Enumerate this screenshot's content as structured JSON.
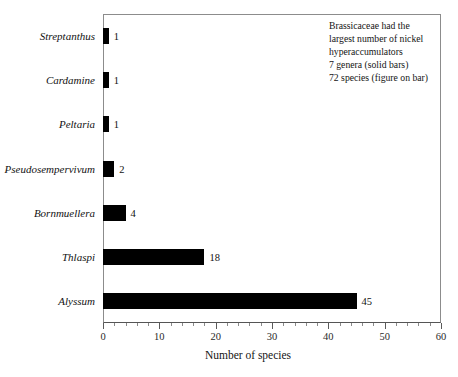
{
  "chart_data": {
    "type": "bar",
    "orientation": "horizontal",
    "title": "",
    "xlabel": "Number of species",
    "ylabel": "",
    "xlim": [
      0,
      60
    ],
    "xticks": [
      0,
      10,
      20,
      30,
      40,
      50,
      60
    ],
    "xtick_labels": [
      "0",
      "10",
      "20",
      "30",
      "40",
      "50",
      "60"
    ],
    "minor_tick_step": 2,
    "grid": false,
    "legend": false,
    "bar_color": "#000000",
    "categories": [
      "Streptanthus",
      "Cardamine",
      "Peltaria",
      "Pseudosempervivum",
      "Bornmuellera",
      "Thlaspi",
      "Alyssum"
    ],
    "values": [
      1,
      1,
      1,
      2,
      4,
      18,
      45
    ],
    "data_labels": [
      "1",
      "1",
      "1",
      "2",
      "4",
      "18",
      "45"
    ],
    "bars": [
      {
        "category": "Streptanthus",
        "value": 1,
        "label": "1"
      },
      {
        "category": "Cardamine",
        "value": 1,
        "label": "1"
      },
      {
        "category": "Peltaria",
        "value": 1,
        "label": "1"
      },
      {
        "category": "Pseudosempervivum",
        "value": 2,
        "label": "2"
      },
      {
        "category": "Bornmuellera",
        "value": 4,
        "label": "4"
      },
      {
        "category": "Thlaspi",
        "value": 18,
        "label": "18"
      },
      {
        "category": "Alyssum",
        "value": 45,
        "label": "45"
      }
    ]
  },
  "annotation": {
    "lines": [
      "Brassicaceae had the",
      "largest number of nickel",
      "hyperaccumulators",
      "7 genera (solid bars)",
      "72 species (figure on bar)"
    ]
  }
}
